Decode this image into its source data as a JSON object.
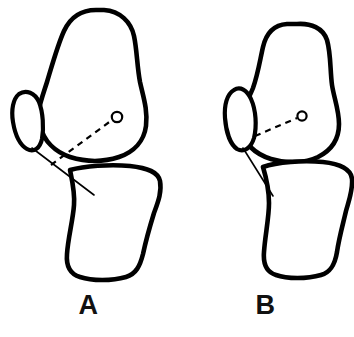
{
  "figure": {
    "background_color": "#ffffff",
    "stroke_color": "#000000",
    "title": "",
    "caption": "",
    "panel_count": 2
  },
  "panels": [
    {
      "id": "A",
      "label": "A",
      "description": "Lateral view of knee joint with femur, patella and tibia; dashed reference axis from patellar tendon insertion to femoral condyle center marker",
      "structures": {
        "femur_label": "femur",
        "patella_label": "patella",
        "tibia_label": "tibia",
        "tendon_label": "patellar-tendon",
        "axis_label": "dashed-reference-axis",
        "marker_label": "condyle-center-marker"
      },
      "geometry": {
        "femur_path": "M 96 10 C 80 10 70 18 64 31 C 58 44 53 62 47 82 C 41 101 36 112 40 126 C 44 141 55 152 70 157 C 86 162 104 162 119 157 C 134 152 144 141 146 126 C 148 110 143 96 140 82 C 137 66 137 50 134 36 C 131 22 120 11 104 10 Z",
        "femur_stroke_width": 4.6,
        "patella_path": "M 19 94 C 13 99 11 110 13 122 C 15 134 20 145 27 149 C 34 153 40 148 42 139 C 44 128 43 112 39 102 C 35 93 26 89 19 94 Z",
        "patella_stroke_width": 4.2,
        "tibia_path": "M 70 170 C 84 166 110 164 130 166 C 148 168 158 172 160 181 C 162 192 158 202 154 213 C 150 226 146 240 143 254 C 140 266 136 274 126 277 C 112 281 92 281 80 277 C 70 274 66 266 67 254 C 68 238 73 220 74 205 C 75 192 72 180 70 170 Z",
        "tibia_stroke_width": 4.6,
        "tendon_path": "M 32 148 L 94 195",
        "axis_path": "M 51 165 L 112 120",
        "marker_cx": 117,
        "marker_cy": 117,
        "marker_r": 5.2
      }
    },
    {
      "id": "B",
      "label": "B",
      "description": "Lateral view of knee joint with femur, patella and tibia in reduced position; shorter, flatter dashed reference axis to condyle center marker",
      "structures": {
        "femur_label": "femur",
        "patella_label": "patella",
        "tibia_label": "tibia",
        "tendon_label": "patellar-tendon",
        "axis_label": "dashed-reference-axis",
        "marker_label": "condyle-center-marker"
      },
      "geometry": {
        "femur_path": "M 110 24 C 96 25 89 34 86 47 C 83 60 81 74 76 88 C 70 103 62 114 64 128 C 66 143 78 154 94 159 C 110 164 128 163 141 157 C 155 150 162 138 162 124 C 162 110 157 98 155 85 C 153 70 154 54 150 40 C 146 28 134 23 120 24 Z",
        "femur_stroke_width": 4.6,
        "patella_path": "M 57 90 C 50 94 47 105 48 118 C 49 131 53 144 60 149 C 67 153 74 148 77 138 C 80 126 79 110 74 99 C 70 90 63 86 57 90 Z",
        "patella_stroke_width": 4.2,
        "tibia_path": "M 86 167 C 100 162 126 160 146 162 C 164 164 174 169 175 179 C 176 190 172 200 169 211 C 166 224 162 238 160 252 C 158 264 154 272 144 275 C 130 279 110 279 99 275 C 89 272 86 264 87 252 C 88 236 92 218 92 203 C 92 190 89 177 86 167 Z",
        "tibia_stroke_width": 4.6,
        "tendon_path": "M 66 148 L 96 196",
        "axis_path": "M 78 136 L 120 118",
        "marker_cx": 125,
        "marker_cy": 116,
        "marker_r": 4.6
      }
    }
  ]
}
